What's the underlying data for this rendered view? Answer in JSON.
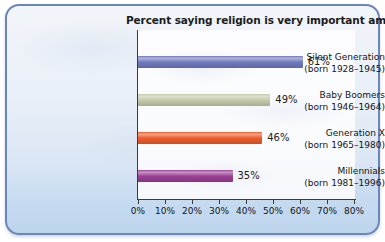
{
  "chart_data": {
    "type": "bar",
    "orientation": "horizontal",
    "title": "Percent saying religion is very important among…",
    "xlabel": "",
    "ylabel": "",
    "xlim": [
      0,
      80
    ],
    "xticks": [
      0,
      10,
      20,
      30,
      40,
      50,
      60,
      70,
      80
    ],
    "xtick_labels": [
      "0%",
      "10%",
      "20%",
      "30%",
      "40%",
      "50%",
      "60%",
      "70%",
      "80%"
    ],
    "grid": false,
    "legend": "none",
    "categories": [
      "Silent Generation (born 1928–1945)",
      "Baby Boomers (born 1946–1964)",
      "Generation X (born 1965–1980)",
      "Millennials (born 1981–1996)"
    ],
    "values": [
      61,
      49,
      46,
      35
    ],
    "value_labels": [
      "61%",
      "49%",
      "46%",
      "35%"
    ],
    "bars": [
      {
        "name": "Silent Generation",
        "birth_years": "(born 1928–1945)",
        "value": 61,
        "value_label": "61%",
        "color": "#6f79bd"
      },
      {
        "name": "Baby Boomers",
        "birth_years": "(born 1946–1964)",
        "value": 49,
        "value_label": "49%",
        "color": "#c3c9a8"
      },
      {
        "name": "Generation X",
        "birth_years": "(born 1965–1980)",
        "value": 46,
        "value_label": "46%",
        "color": "#ec5b2a"
      },
      {
        "name": "Millennials",
        "birth_years": "(born 1981–1996)",
        "value": 35,
        "value_label": "35%",
        "color": "#9b3f95"
      }
    ]
  },
  "style": {
    "panel_border": "#6b86bd",
    "panel_background": "#e4edf8",
    "plot_background": "#fdfdfe",
    "axis_color": "#3b3b3b",
    "text_color": "#141414"
  }
}
